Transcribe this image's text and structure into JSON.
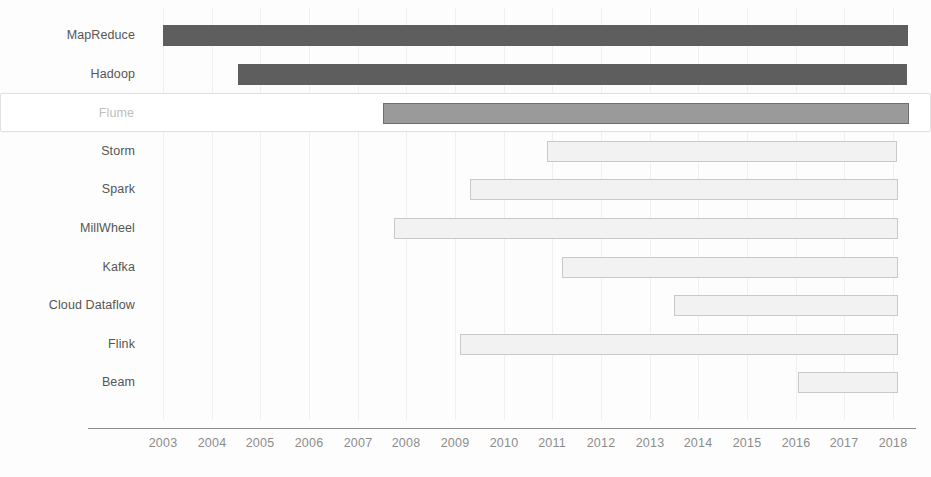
{
  "chart_data": {
    "type": "bar",
    "orientation": "horizontal",
    "subtype": "gantt-timeline",
    "title": "",
    "subtitle": "",
    "xlabel": "",
    "ylabel": "",
    "xlim": [
      2002.75,
      2018.25
    ],
    "grid": true,
    "legend": false,
    "legend_position": "none",
    "x_ticks": [
      2003,
      2004,
      2005,
      2006,
      2007,
      2008,
      2009,
      2010,
      2011,
      2012,
      2013,
      2014,
      2015,
      2016,
      2017,
      2018
    ],
    "x_tick_labels": [
      "2003",
      "2004",
      "2005",
      "2006",
      "2007",
      "2008",
      "2009",
      "2010",
      "2011",
      "2012",
      "2013",
      "2014",
      "2015",
      "2016",
      "2017",
      "2018"
    ],
    "categories": [
      "MapReduce",
      "Hadoop",
      "Flume",
      "Storm",
      "Spark",
      "MillWheel",
      "Kafka",
      "Cloud Dataflow",
      "Flink",
      "Beam"
    ],
    "series": [
      {
        "name": "lifespan",
        "bars": [
          {
            "label": "MapReduce",
            "start": 2003.0,
            "end": 2018.3,
            "style": "dark",
            "selected": false
          },
          {
            "label": "Hadoop",
            "start": 2004.55,
            "end": 2018.3,
            "style": "dark",
            "selected": false
          },
          {
            "label": "Flume",
            "start": 2007.5,
            "end": 2018.3,
            "style": "mid",
            "selected": true
          },
          {
            "label": "Storm",
            "start": 2010.9,
            "end": 2018.1,
            "style": "light",
            "selected": false
          },
          {
            "label": "Spark",
            "start": 2009.3,
            "end": 2018.1,
            "style": "light",
            "selected": false
          },
          {
            "label": "MillWheel",
            "start": 2007.75,
            "end": 2018.1,
            "style": "light",
            "selected": false
          },
          {
            "label": "Kafka",
            "start": 2011.2,
            "end": 2018.1,
            "style": "light",
            "selected": false
          },
          {
            "label": "Cloud Dataflow",
            "start": 2013.5,
            "end": 2018.1,
            "style": "light",
            "selected": false
          },
          {
            "label": "Flink",
            "start": 2009.1,
            "end": 2018.1,
            "style": "light",
            "selected": false
          },
          {
            "label": "Beam",
            "start": 2016.05,
            "end": 2018.1,
            "style": "light",
            "selected": false
          }
        ]
      }
    ],
    "colors": {
      "bar_dark": "#5e5e5e",
      "bar_mid": "#9a9a9a",
      "bar_light_fill": "#f2f2f2",
      "bar_light_stroke": "#c9c9c9",
      "gridline": "#f0f0f0",
      "axis_line": "#8a8a8a",
      "label_text": "#555555",
      "selected_label_text": "#bdbdbd",
      "tick_text": "#8c8c8c",
      "selection_border": "#e2e2e2",
      "background": "#fdfdfd"
    }
  },
  "rows": [
    {
      "label": "MapReduce"
    },
    {
      "label": "Hadoop"
    },
    {
      "label": "Flume"
    },
    {
      "label": "Storm"
    },
    {
      "label": "Spark"
    },
    {
      "label": "MillWheel"
    },
    {
      "label": "Kafka"
    },
    {
      "label": "Cloud Dataflow"
    },
    {
      "label": "Flink"
    },
    {
      "label": "Beam"
    }
  ],
  "axis": {
    "ticks": [
      "2003",
      "2004",
      "2005",
      "2006",
      "2007",
      "2008",
      "2009",
      "2010",
      "2011",
      "2012",
      "2013",
      "2014",
      "2015",
      "2016",
      "2017",
      "2018"
    ]
  }
}
